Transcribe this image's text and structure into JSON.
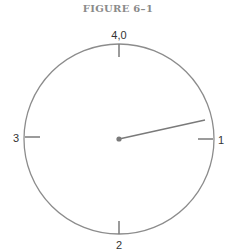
{
  "figure": {
    "title": "FIGURE 6–1",
    "dial": {
      "center": [
        119,
        139
      ],
      "radius": 95,
      "stroke_color": "#8c8c8c",
      "labels": {
        "top": "4,0",
        "right": "1",
        "bottom": "2",
        "left": "3"
      },
      "pointer": {
        "from": [
          119,
          139
        ],
        "to": [
          205,
          119
        ],
        "color": "#7a7a7a"
      }
    }
  }
}
